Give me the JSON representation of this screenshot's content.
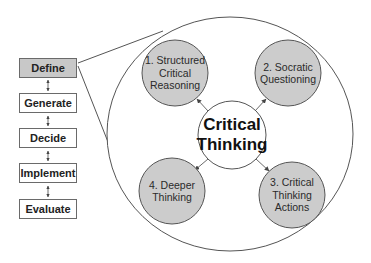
{
  "process_steps": [
    {
      "label": "Define",
      "active": true
    },
    {
      "label": "Generate",
      "active": false
    },
    {
      "label": "Decide",
      "active": false
    },
    {
      "label": "Implement",
      "active": false
    },
    {
      "label": "Evaluate",
      "active": false
    }
  ],
  "center": {
    "label": "Critical\nThinking"
  },
  "nodes": [
    {
      "label": "1. Structured\nCritical\nReasoning"
    },
    {
      "label": "2. Socratic\nQuestioning"
    },
    {
      "label": "3. Critical\nThinking\nActions"
    },
    {
      "label": "4. Deeper\nThinking"
    }
  ],
  "colors": {
    "active_step_fill": "#c8c8c8",
    "node_fill": "#cccccc",
    "stroke": "#555555",
    "background": "#ffffff"
  }
}
